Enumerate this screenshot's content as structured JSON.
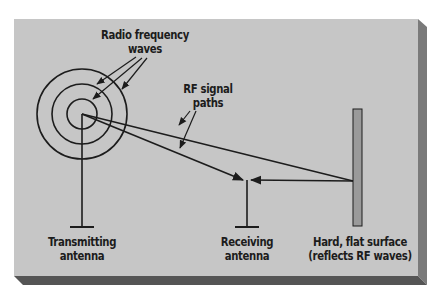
{
  "diagram": {
    "colors": {
      "panel": "#c6c6c6",
      "panel_shadow": "#707070",
      "line": "#1c1c1c",
      "surface_fill": "#9a9a9a"
    },
    "labels": {
      "rf_waves_line1": "Radio frequency",
      "rf_waves_line2": "waves",
      "rf_paths_line1": "RF signal",
      "rf_paths_line2": "paths",
      "tx_line1": "Transmitting",
      "tx_line2": "antenna",
      "rx_line1": "Receiving",
      "rx_line2": "antenna",
      "surface_line1": "Hard, flat surface",
      "surface_line2": "(reflects RF waves)"
    },
    "nodes": [
      {
        "id": "transmitting-antenna",
        "label": "Transmitting antenna"
      },
      {
        "id": "receiving-antenna",
        "label": "Receiving antenna"
      },
      {
        "id": "reflective-surface",
        "label": "Hard, flat surface (reflects RF waves)"
      }
    ],
    "edges": [
      {
        "from": "transmitting-antenna",
        "to": "receiving-antenna",
        "type": "direct path"
      },
      {
        "from": "transmitting-antenna",
        "to": "reflective-surface",
        "type": "incident path"
      },
      {
        "from": "reflective-surface",
        "to": "receiving-antenna",
        "type": "reflected path"
      }
    ]
  }
}
